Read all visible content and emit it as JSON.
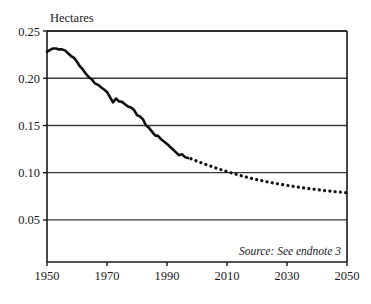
{
  "chart_data": {
    "type": "line",
    "title": "",
    "ylabel": "Hectares",
    "xlabel": "",
    "xlim": [
      1950,
      2050
    ],
    "ylim": [
      0,
      0.25
    ],
    "grid": true,
    "legend": null,
    "ytick_labels": [
      "0.25",
      "0.20",
      "0.15",
      "0.10",
      "0.05"
    ],
    "ytick_values": [
      0.25,
      0.2,
      0.15,
      0.1,
      0.05
    ],
    "xtick_labels": [
      "1950",
      "1970",
      "1990",
      "2010",
      "2030",
      "2050"
    ],
    "xtick_values": [
      1950,
      1970,
      1990,
      2010,
      2030,
      2050
    ],
    "annotations": [
      {
        "text": "Source: See endnote 3",
        "x": 2035,
        "y": 0.018,
        "style": "italic"
      }
    ],
    "series": [
      {
        "name": "Grainland per person (historical)",
        "style": "solid",
        "color": "#111111",
        "width": 2.6,
        "x": [
          1950,
          1951,
          1952,
          1953,
          1954,
          1955,
          1956,
          1957,
          1958,
          1959,
          1960,
          1961,
          1962,
          1963,
          1964,
          1965,
          1966,
          1967,
          1968,
          1969,
          1970,
          1971,
          1972,
          1973,
          1974,
          1975,
          1976,
          1977,
          1978,
          1979,
          1980,
          1981,
          1982,
          1983,
          1984,
          1985,
          1986,
          1987,
          1988,
          1989,
          1990,
          1991,
          1992,
          1993,
          1994,
          1995,
          1996,
          1997
        ],
        "values": [
          0.228,
          0.23,
          0.2315,
          0.2315,
          0.2305,
          0.2305,
          0.2295,
          0.2265,
          0.2235,
          0.2215,
          0.2175,
          0.2125,
          0.209,
          0.2045,
          0.201,
          0.1985,
          0.1945,
          0.193,
          0.1905,
          0.188,
          0.1855,
          0.18,
          0.1745,
          0.1785,
          0.1755,
          0.175,
          0.1725,
          0.17,
          0.169,
          0.1665,
          0.161,
          0.1595,
          0.1565,
          0.15,
          0.1475,
          0.1435,
          0.1395,
          0.139,
          0.1355,
          0.133,
          0.1305,
          0.1275,
          0.1245,
          0.1215,
          0.1185,
          0.1195,
          0.1165,
          0.1155
        ]
      },
      {
        "name": "Grainland per person (projected)",
        "style": "dotted",
        "color": "#111111",
        "width": 3.2,
        "x": [
          1998,
          1999,
          2000,
          2001,
          2002,
          2003,
          2004,
          2005,
          2006,
          2007,
          2008,
          2009,
          2010,
          2011,
          2012,
          2013,
          2014,
          2015,
          2016,
          2017,
          2018,
          2019,
          2020,
          2021,
          2022,
          2023,
          2024,
          2025,
          2026,
          2027,
          2028,
          2029,
          2030,
          2031,
          2032,
          2033,
          2034,
          2035,
          2036,
          2037,
          2038,
          2039,
          2040,
          2041,
          2042,
          2043,
          2044,
          2045,
          2046,
          2047,
          2048,
          2049,
          2050
        ],
        "values": [
          0.1148,
          0.1135,
          0.1122,
          0.111,
          0.1098,
          0.1086,
          0.1075,
          0.1064,
          0.1053,
          0.1043,
          0.1032,
          0.1022,
          0.1012,
          0.1002,
          0.0993,
          0.0984,
          0.0975,
          0.0966,
          0.0958,
          0.095,
          0.0942,
          0.0934,
          0.0927,
          0.092,
          0.0913,
          0.0906,
          0.09,
          0.0894,
          0.0888,
          0.0882,
          0.0876,
          0.0871,
          0.0866,
          0.0861,
          0.0856,
          0.0851,
          0.0846,
          0.0842,
          0.0837,
          0.0833,
          0.0829,
          0.0825,
          0.0821,
          0.0817,
          0.0813,
          0.081,
          0.0806,
          0.0803,
          0.0799,
          0.0796,
          0.0793,
          0.079,
          0.0787
        ]
      }
    ],
    "colors": {
      "line": "#111111",
      "grid": "#3a3a3a",
      "axis": "#1a1a1a",
      "background": "#ffffff"
    }
  },
  "geometry": {
    "plot_left": 47,
    "plot_right": 347,
    "plot_top": 31,
    "plot_bottom": 262,
    "y_top_value": 0.25,
    "y_bottom_value": 0.0055
  }
}
